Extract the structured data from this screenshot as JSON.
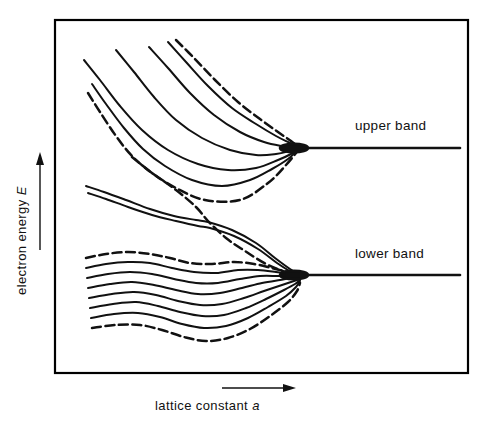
{
  "figure": {
    "title": "",
    "frame": {
      "x": 55,
      "y": 20,
      "width": 413,
      "height": 353,
      "stroke": "#000000",
      "stroke_width": 2.2
    },
    "background": "#ffffff",
    "ink_color": "#111111"
  },
  "axes": {
    "y": {
      "label_text": "electron energy",
      "label_symbol": "E",
      "arrow_direction": "up",
      "orientation": "vertical",
      "position": "left-outside"
    },
    "x": {
      "label_text": "lattice constant",
      "label_symbol": "a",
      "arrow_direction": "right",
      "orientation": "horizontal",
      "position": "bottom-outside"
    }
  },
  "annotations": [
    {
      "name": "upper-band-label",
      "text": "upper band",
      "x": 355,
      "y": 130
    },
    {
      "name": "lower-band-label",
      "text": "lower band",
      "x": 355,
      "y": 258
    }
  ],
  "chart_data": {
    "type": "line",
    "title": "",
    "xlabel": "lattice constant a",
    "ylabel": "electron energy E",
    "grid": false,
    "legend": "none",
    "xlim": [
      55,
      468
    ],
    "ylim": [
      20,
      373
    ],
    "convergence_points": [
      {
        "name": "upper-band-degenerate-level",
        "x": 300,
        "y": 148
      },
      {
        "name": "lower-band-degenerate-level",
        "x": 300,
        "y": 275
      }
    ],
    "asymptote_lines": [
      {
        "name": "upper-band-asymptote",
        "x1": 300,
        "y1": 148,
        "x2": 460,
        "y2": 148,
        "style": "solid"
      },
      {
        "name": "lower-band-asymptote",
        "x1": 300,
        "y1": 275,
        "x2": 460,
        "y2": 275,
        "style": "solid"
      }
    ],
    "series": [
      {
        "name": "upper-1-dashed",
        "band": "upper",
        "style": "dashed",
        "points": [
          [
            88,
            93
          ],
          [
            100,
            112
          ],
          [
            116,
            136
          ],
          [
            132,
            156
          ],
          [
            152,
            173
          ],
          [
            176,
            188
          ],
          [
            205,
            200
          ],
          [
            240,
            200
          ],
          [
            268,
            183
          ],
          [
            286,
            165
          ],
          [
            300,
            148
          ]
        ]
      },
      {
        "name": "upper-2-solid",
        "band": "upper",
        "style": "solid",
        "points": [
          [
            92,
            84
          ],
          [
            106,
            104
          ],
          [
            124,
            128
          ],
          [
            143,
            149
          ],
          [
            165,
            166
          ],
          [
            192,
            180
          ],
          [
            222,
            186
          ],
          [
            250,
            180
          ],
          [
            272,
            169
          ],
          [
            288,
            159
          ],
          [
            300,
            148
          ]
        ]
      },
      {
        "name": "upper-3-solid",
        "band": "upper",
        "style": "solid",
        "points": [
          [
            84,
            60
          ],
          [
            100,
            80
          ],
          [
            120,
            106
          ],
          [
            142,
            130
          ],
          [
            168,
            150
          ],
          [
            198,
            164
          ],
          [
            228,
            170
          ],
          [
            256,
            168
          ],
          [
            278,
            160
          ],
          [
            291,
            154
          ],
          [
            300,
            148
          ]
        ]
      },
      {
        "name": "upper-4-solid",
        "band": "upper",
        "style": "solid",
        "points": [
          [
            116,
            50
          ],
          [
            134,
            72
          ],
          [
            154,
            97
          ],
          [
            176,
            120
          ],
          [
            202,
            138
          ],
          [
            230,
            150
          ],
          [
            256,
            155
          ],
          [
            276,
            154
          ],
          [
            290,
            151
          ],
          [
            300,
            148
          ]
        ]
      },
      {
        "name": "upper-5-solid",
        "band": "upper",
        "style": "solid",
        "points": [
          [
            149,
            47
          ],
          [
            168,
            68
          ],
          [
            190,
            93
          ],
          [
            214,
            115
          ],
          [
            240,
            132
          ],
          [
            264,
            142
          ],
          [
            282,
            146
          ],
          [
            293,
            147
          ],
          [
            300,
            148
          ]
        ]
      },
      {
        "name": "upper-6-solid",
        "band": "upper",
        "style": "solid",
        "points": [
          [
            168,
            42
          ],
          [
            186,
            62
          ],
          [
            208,
            86
          ],
          [
            232,
            108
          ],
          [
            256,
            124
          ],
          [
            276,
            136
          ],
          [
            290,
            143
          ],
          [
            300,
            148
          ]
        ]
      },
      {
        "name": "upper-7-dashed",
        "band": "upper",
        "style": "dashed",
        "points": [
          [
            176,
            40
          ],
          [
            194,
            58
          ],
          [
            215,
            80
          ],
          [
            238,
            102
          ],
          [
            260,
            119
          ],
          [
            278,
            132
          ],
          [
            291,
            141
          ],
          [
            300,
            148
          ]
        ]
      },
      {
        "name": "mid-lower-branch-solid",
        "band": "crossing",
        "style": "solid",
        "points": [
          [
            86,
            186
          ],
          [
            104,
            192
          ],
          [
            126,
            200
          ],
          [
            150,
            209
          ],
          [
            174,
            216
          ],
          [
            196,
            220
          ],
          [
            208,
            222
          ],
          [
            232,
            230
          ],
          [
            256,
            243
          ],
          [
            275,
            258
          ],
          [
            290,
            269
          ],
          [
            300,
            275
          ]
        ]
      },
      {
        "name": "mid-lower-branch-solid-b",
        "band": "crossing",
        "style": "solid",
        "points": [
          [
            88,
            193
          ],
          [
            106,
            199
          ],
          [
            128,
            207
          ],
          [
            152,
            215
          ],
          [
            176,
            221
          ],
          [
            198,
            226
          ],
          [
            210,
            228
          ],
          [
            234,
            236
          ],
          [
            258,
            249
          ],
          [
            277,
            263
          ],
          [
            291,
            272
          ],
          [
            300,
            277
          ]
        ]
      },
      {
        "name": "mid-upper-branch-dashed",
        "band": "crossing",
        "style": "dashed",
        "points": [
          [
            132,
            157
          ],
          [
            152,
            173
          ],
          [
            176,
            190
          ],
          [
            196,
            207
          ],
          [
            208,
            221
          ],
          [
            226,
            238
          ],
          [
            245,
            251
          ],
          [
            266,
            264
          ],
          [
            286,
            272
          ],
          [
            300,
            275
          ]
        ]
      },
      {
        "name": "lower-1-dashed",
        "band": "lower",
        "style": "dashed",
        "points": [
          [
            86,
            258
          ],
          [
            106,
            254
          ],
          [
            128,
            252
          ],
          [
            150,
            254
          ],
          [
            170,
            258
          ],
          [
            190,
            263
          ],
          [
            212,
            264
          ],
          [
            234,
            262
          ],
          [
            254,
            264
          ],
          [
            272,
            268
          ],
          [
            288,
            272
          ],
          [
            300,
            275
          ]
        ]
      },
      {
        "name": "lower-2-solid",
        "band": "lower",
        "style": "solid",
        "points": [
          [
            86,
            268
          ],
          [
            106,
            264
          ],
          [
            128,
            262
          ],
          [
            150,
            263
          ],
          [
            172,
            268
          ],
          [
            194,
            272
          ],
          [
            216,
            273
          ],
          [
            238,
            270
          ],
          [
            258,
            270
          ],
          [
            276,
            272
          ],
          [
            290,
            274
          ],
          [
            300,
            276
          ]
        ]
      },
      {
        "name": "lower-3-solid",
        "band": "lower",
        "style": "solid",
        "points": [
          [
            87,
            278
          ],
          [
            108,
            274
          ],
          [
            130,
            272
          ],
          [
            152,
            274
          ],
          [
            174,
            279
          ],
          [
            196,
            283
          ],
          [
            218,
            283
          ],
          [
            240,
            279
          ],
          [
            260,
            276
          ],
          [
            278,
            276
          ],
          [
            292,
            276
          ],
          [
            300,
            277
          ]
        ]
      },
      {
        "name": "lower-4-solid",
        "band": "lower",
        "style": "solid",
        "points": [
          [
            88,
            288
          ],
          [
            110,
            284
          ],
          [
            132,
            282
          ],
          [
            154,
            285
          ],
          [
            176,
            290
          ],
          [
            198,
            294
          ],
          [
            220,
            293
          ],
          [
            242,
            288
          ],
          [
            262,
            283
          ],
          [
            280,
            280
          ],
          [
            293,
            278
          ],
          [
            300,
            278
          ]
        ]
      },
      {
        "name": "lower-5-solid",
        "band": "lower",
        "style": "solid",
        "points": [
          [
            89,
            298
          ],
          [
            112,
            294
          ],
          [
            134,
            292
          ],
          [
            156,
            295
          ],
          [
            178,
            301
          ],
          [
            200,
            305
          ],
          [
            222,
            304
          ],
          [
            244,
            298
          ],
          [
            264,
            291
          ],
          [
            282,
            285
          ],
          [
            294,
            281
          ],
          [
            300,
            279
          ]
        ]
      },
      {
        "name": "lower-6-solid",
        "band": "lower",
        "style": "solid",
        "points": [
          [
            90,
            308
          ],
          [
            113,
            304
          ],
          [
            136,
            302
          ],
          [
            158,
            306
          ],
          [
            180,
            312
          ],
          [
            202,
            316
          ],
          [
            224,
            315
          ],
          [
            246,
            308
          ],
          [
            266,
            299
          ],
          [
            284,
            290
          ],
          [
            295,
            284
          ],
          [
            300,
            280
          ]
        ]
      },
      {
        "name": "lower-7-solid",
        "band": "lower",
        "style": "solid",
        "points": [
          [
            91,
            318
          ],
          [
            114,
            314
          ],
          [
            138,
            313
          ],
          [
            160,
            317
          ],
          [
            182,
            324
          ],
          [
            204,
            328
          ],
          [
            226,
            326
          ],
          [
            248,
            318
          ],
          [
            268,
            307
          ],
          [
            286,
            296
          ],
          [
            296,
            287
          ],
          [
            300,
            281
          ]
        ]
      },
      {
        "name": "lower-8-dashed",
        "band": "lower",
        "style": "dashed",
        "points": [
          [
            92,
            328
          ],
          [
            116,
            325
          ],
          [
            140,
            325
          ],
          [
            162,
            330
          ],
          [
            184,
            337
          ],
          [
            206,
            341
          ],
          [
            228,
            338
          ],
          [
            250,
            329
          ],
          [
            270,
            316
          ],
          [
            288,
            302
          ],
          [
            297,
            291
          ],
          [
            300,
            283
          ]
        ]
      }
    ]
  }
}
